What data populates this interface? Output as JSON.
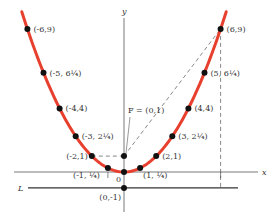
{
  "chart_data": {
    "type": "line",
    "title": "",
    "function": "y = x^2 / 4",
    "xlabel": "x",
    "ylabel": "y",
    "xlim": [
      -6.5,
      8.5
    ],
    "ylim": [
      -2.5,
      9.6
    ],
    "curve_color": "#e8402e",
    "origin_label": "0",
    "directrix": {
      "label": "L",
      "y": -1
    },
    "focus": {
      "label": "F = (0,1)",
      "x": 0,
      "y": 1
    },
    "points": [
      {
        "x": -6,
        "y": 9,
        "label": "(-6,9)"
      },
      {
        "x": -5,
        "y": 6.25,
        "label": "(-5, 6¼)"
      },
      {
        "x": -4,
        "y": 4,
        "label": "(-4,4)"
      },
      {
        "x": -3,
        "y": 2.25,
        "label": "(-3, 2¼)"
      },
      {
        "x": -2,
        "y": 1,
        "label": "(-2,1)"
      },
      {
        "x": -1,
        "y": 0.25,
        "label": "(-1, ¼)"
      },
      {
        "x": 0,
        "y": 0,
        "label": ""
      },
      {
        "x": 1,
        "y": 0.25,
        "label": "(1, ¼)"
      },
      {
        "x": 2,
        "y": 1,
        "label": "(2,1)"
      },
      {
        "x": 3,
        "y": 2.25,
        "label": "(3, 2¼)"
      },
      {
        "x": 4,
        "y": 4,
        "label": "(4,4)"
      },
      {
        "x": 5,
        "y": 6.25,
        "label": "(5, 6¼)"
      },
      {
        "x": 6,
        "y": 9,
        "label": "(6,9)"
      }
    ],
    "extra_points": [
      {
        "x": 0,
        "y": 1,
        "label": ""
      },
      {
        "x": 0,
        "y": -1,
        "label": "(0,-1)"
      }
    ],
    "dashed_lines": [
      {
        "from": [
          0,
          1
        ],
        "to": [
          6,
          9
        ]
      },
      {
        "from": [
          6,
          9
        ],
        "to": [
          6,
          -1
        ]
      },
      {
        "from": [
          -2,
          1
        ],
        "to": [
          0,
          1
        ]
      }
    ],
    "tick_marks_x": [
      -1,
      6
    ]
  }
}
